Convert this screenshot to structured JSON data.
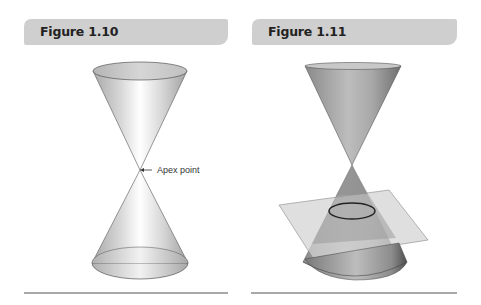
{
  "figures": [
    {
      "title": "Figure 1.10",
      "description": "Double cone (two nappes) meeting at a point",
      "annotation": "Apex point"
    },
    {
      "title": "Figure 1.11",
      "description": "Double cone intersected by a plane producing an ellipse"
    }
  ],
  "colors": {
    "header_bg": "#cfcfcf",
    "rule": "#a8a8a8",
    "cone_light": "#f4f4f4",
    "cone_dark": "#9a9a9a",
    "plane": "#c8c8c8"
  }
}
